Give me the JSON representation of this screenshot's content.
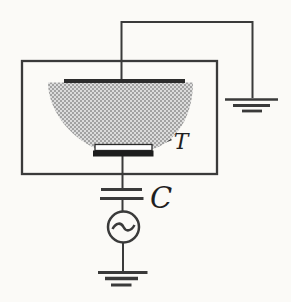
{
  "figure": {
    "type": "schematic-diagram",
    "labels": {
      "target": "T",
      "capacitor": "C"
    },
    "colors": {
      "background": "#fbfaf7",
      "line": "#3a3a3a",
      "electrode_fill": "#2c2c2c",
      "target_bar_fill": "#1d1d1d",
      "target_holder_fill": "#ffffff",
      "target_holder_stroke": "#2a2a2a",
      "plasma_dot": "#8a8a8a",
      "plasma_base": "#dcdcdc"
    },
    "components": [
      "vacuum-chamber",
      "plasma-glow-region",
      "top-electrode",
      "target-electrode",
      "blocking-capacitor",
      "ac-source",
      "chamber-ground",
      "source-ground"
    ]
  }
}
